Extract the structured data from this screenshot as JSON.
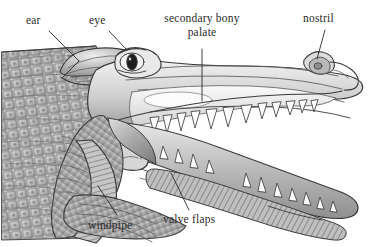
{
  "figure": {
    "background_color": "#ffffff",
    "label_color": "#2b2b2b",
    "ink_color": "#3a3a3a"
  },
  "labels": {
    "ear": "ear",
    "eye": "eye",
    "palate_line1": "secondary bony",
    "palate_line2": "palate",
    "nostril": "nostril",
    "windpipe": "windpipe",
    "valve_flaps": "valve flaps"
  }
}
